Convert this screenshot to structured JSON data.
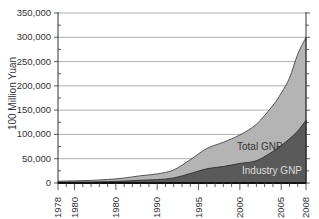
{
  "chart_data": {
    "type": "area",
    "title": "",
    "xlabel": "",
    "ylabel": "100 Million Yuan",
    "ylim": [
      0,
      350000
    ],
    "xlim": [
      1978,
      2008
    ],
    "grid": true,
    "y_ticks": [
      "0",
      "50,000",
      "100,000",
      "150,000",
      "200,000",
      "250,000",
      "300,000",
      "350,000"
    ],
    "y_tick_values": [
      0,
      50000,
      100000,
      150000,
      200000,
      250000,
      300000,
      350000
    ],
    "x_tick_labels": [
      "1978",
      "1980",
      "1980",
      "1990",
      "1995",
      "2000",
      "2005",
      "2008"
    ],
    "x_tick_years": [
      1978,
      1980,
      1985,
      1990,
      1995,
      2000,
      2005,
      2008
    ],
    "x": [
      1978,
      1980,
      1982,
      1984,
      1986,
      1988,
      1990,
      1992,
      1994,
      1996,
      1998,
      2000,
      2002,
      2004,
      2005,
      2006,
      2007,
      2008
    ],
    "series": [
      {
        "name": "Total GNP",
        "color": "#b4b4b4",
        "values": [
          3600,
          4500,
          5300,
          7200,
          10200,
          15000,
          18700,
          27000,
          48000,
          71000,
          84000,
          99000,
          121000,
          160000,
          185000,
          216000,
          265000,
          300000
        ]
      },
      {
        "name": "Industry GNP",
        "color": "#5a5a5a",
        "values": [
          1600,
          2000,
          2200,
          2800,
          3900,
          5800,
          6900,
          10300,
          19500,
          29400,
          34000,
          40300,
          45900,
          65000,
          77000,
          91000,
          107000,
          129000
        ]
      }
    ],
    "annotations": [
      {
        "text": "Total GNP",
        "x": 2001,
        "y": 72000
      },
      {
        "text": "Industry GNP",
        "x": 2002,
        "y": 20000
      }
    ]
  }
}
